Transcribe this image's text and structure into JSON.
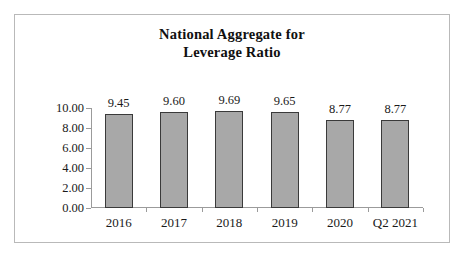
{
  "chart_data": {
    "type": "bar",
    "title": "National Aggregate for Leverage Ratio",
    "title_lines": [
      "National Aggregate for",
      "Leverage Ratio"
    ],
    "categories": [
      "2016",
      "2017",
      "2018",
      "2019",
      "2020",
      "Q2 2021"
    ],
    "values": [
      9.45,
      9.6,
      9.69,
      9.65,
      8.77,
      8.77
    ],
    "value_labels": [
      "9.45",
      "9.60",
      "9.69",
      "9.65",
      "8.77",
      "8.77"
    ],
    "xlabel": "",
    "ylabel": "",
    "ylim": [
      0,
      10
    ],
    "ytick_values": [
      0,
      2,
      4,
      6,
      8,
      10
    ],
    "ytick_labels": [
      "0.00",
      "2.00",
      "4.00",
      "6.00",
      "8.00",
      "10.00"
    ],
    "grid": false,
    "legend": false,
    "series": [
      {
        "name": "Leverage Ratio",
        "values": [
          9.45,
          9.6,
          9.69,
          9.65,
          8.77,
          8.77
        ]
      }
    ],
    "colors": {
      "bar_fill": "#a8a8a8",
      "bar_outline": "#3a3a3a",
      "axis": "#9b9b9b",
      "text": "#1a1a1a",
      "frame_border": "#b9b9b9",
      "background": "#ffffff"
    }
  }
}
